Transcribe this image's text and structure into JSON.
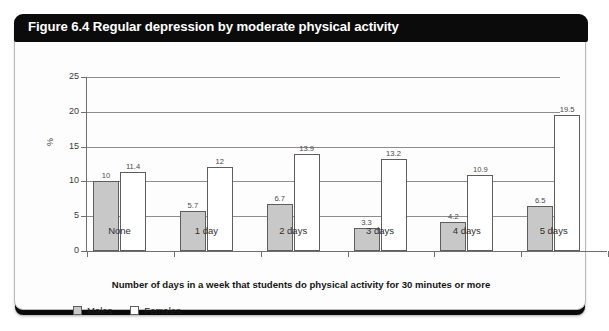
{
  "header": {
    "title": "Figure 6.4 Regular depression by moderate physical activity"
  },
  "legend": {
    "items": [
      {
        "label": "Males",
        "swatch": "males",
        "color": "#c8c8c8"
      },
      {
        "label": "Females",
        "swatch": "females",
        "color": "#ffffff"
      }
    ]
  },
  "chart_data": {
    "type": "bar",
    "title": "Figure 6.4 Regular depression by moderate physical activity",
    "xlabel": "Number of days in a week that students do physical activity for 30 minutes or more",
    "ylabel": "%",
    "ylim": [
      0,
      25
    ],
    "yticks": [
      0,
      5,
      10,
      15,
      20,
      25
    ],
    "ytick_labels": [
      "0",
      "5",
      "10",
      "15",
      "20",
      "25"
    ],
    "grid": true,
    "legend_position": "bottom-left",
    "categories": [
      "None",
      "1 day",
      "2 days",
      "3 days",
      "4 days",
      "5 days"
    ],
    "series": [
      {
        "name": "Males",
        "color": "#c8c8c8",
        "values": [
          10,
          5.7,
          6.7,
          3.3,
          4.2,
          6.5
        ],
        "labels": [
          "10",
          "5.7",
          "6.7",
          "3.3",
          "4.2",
          "6.5"
        ]
      },
      {
        "name": "Females",
        "color": "#ffffff",
        "values": [
          11.4,
          12,
          13.9,
          13.2,
          10.9,
          19.5
        ],
        "labels": [
          "11.4",
          "12",
          "13.9",
          "13.2",
          "10.9",
          "19.5"
        ]
      }
    ]
  }
}
